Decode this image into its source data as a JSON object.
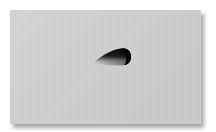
{
  "scene": {
    "description": "Gray card with a teardrop-shaped cutout casting an inner shadow",
    "background_color": "#ffffff",
    "card": {
      "color": "#cfcfcf",
      "shadow_color": "#8a8a8a"
    },
    "cutout": {
      "shape": "teardrop",
      "dark_color": "#111111",
      "light_color": "#e6e6e6"
    }
  }
}
